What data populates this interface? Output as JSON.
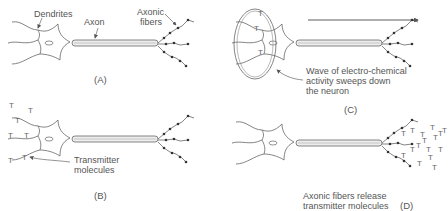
{
  "figure": {
    "panels": [
      {
        "id": "A",
        "label": "(A)",
        "annotations": [
          "Dendrites",
          "Axon",
          "Axonic",
          "fibers"
        ]
      },
      {
        "id": "B",
        "label": "(B)",
        "annotations": [
          "Transmitter",
          "molecules"
        ]
      },
      {
        "id": "C",
        "label": "(C)",
        "annotations": [
          "Wave of electro-chemical",
          "activity sweeps down",
          "the neuron"
        ]
      },
      {
        "id": "D",
        "label": "(D)",
        "annotations": [
          "Axonic fibers release",
          "transmitter molecules"
        ]
      }
    ],
    "symbol": "T",
    "colors": {
      "line": "#555555",
      "text": "#555555",
      "background": "#ffffff"
    }
  }
}
